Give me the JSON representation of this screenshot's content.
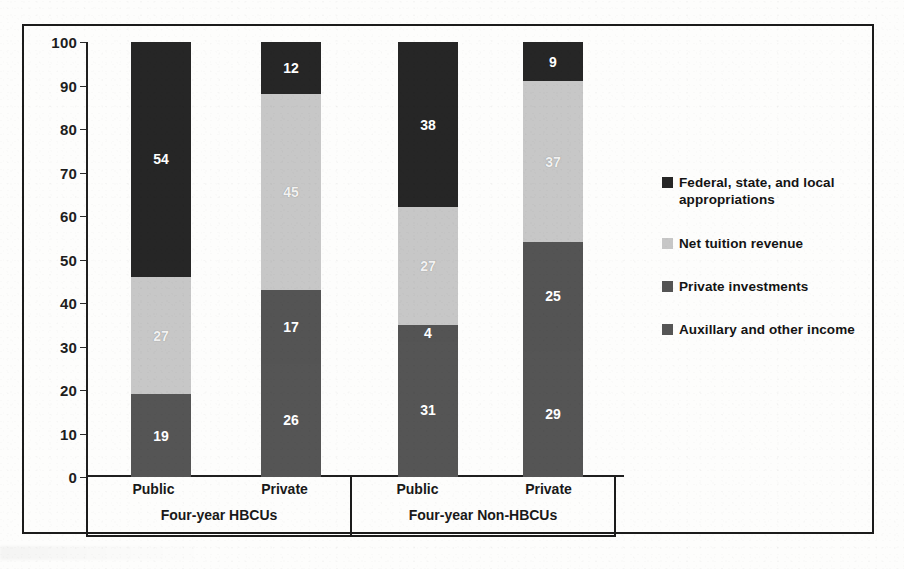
{
  "chart_data": {
    "type": "bar",
    "stacked": true,
    "orientation": "vertical",
    "title": "",
    "subtitle": "",
    "xlabel": "",
    "ylabel": "",
    "ylim": [
      0,
      100
    ],
    "yticks": [
      0,
      10,
      20,
      30,
      40,
      50,
      60,
      70,
      80,
      90,
      100
    ],
    "ytick_labels": [
      "0",
      "10",
      "20",
      "30",
      "40",
      "50",
      "60",
      "70",
      "80",
      "90",
      "100"
    ],
    "grid": false,
    "legend_position": "right",
    "categories": [
      "Public",
      "Private",
      "Public",
      "Private"
    ],
    "groups": [
      {
        "label": "Four-year HBCUs",
        "categories": [
          "Public",
          "Private"
        ]
      },
      {
        "label": "Four-year Non-HBCUs",
        "categories": [
          "Public",
          "Private"
        ]
      }
    ],
    "series": [
      {
        "name": "Federal, state, and local appropriations",
        "color": "#262626",
        "values": [
          54,
          12,
          38,
          9
        ]
      },
      {
        "name": "Net tuition revenue",
        "color": "#c7c7c7",
        "values": [
          27,
          45,
          27,
          37
        ]
      },
      {
        "name": "Private investments",
        "color": "#545454",
        "values": [
          0,
          17,
          4,
          25
        ]
      },
      {
        "name": "Auxillary and other income",
        "color": "#555555",
        "values": [
          19,
          26,
          31,
          29
        ]
      }
    ],
    "bars": [
      {
        "group": "Four-year HBCUs",
        "category": "Public",
        "segments": [
          {
            "series": "Auxillary and other income",
            "value": 19,
            "label": "19",
            "color": "#555555"
          },
          {
            "series": "Private investments",
            "value": 0,
            "label": "",
            "color": "#545454"
          },
          {
            "series": "Net tuition revenue",
            "value": 27,
            "label": "27",
            "color": "#c7c7c7"
          },
          {
            "series": "Federal, state, and local appropriations",
            "value": 54,
            "label": "54",
            "color": "#262626"
          }
        ],
        "total": 100
      },
      {
        "group": "Four-year HBCUs",
        "category": "Private",
        "segments": [
          {
            "series": "Auxillary and other income",
            "value": 26,
            "label": "26",
            "color": "#555555"
          },
          {
            "series": "Private investments",
            "value": 17,
            "label": "17",
            "color": "#545454"
          },
          {
            "series": "Net tuition revenue",
            "value": 45,
            "label": "45",
            "color": "#c7c7c7"
          },
          {
            "series": "Federal, state, and local appropriations",
            "value": 12,
            "label": "12",
            "color": "#262626"
          }
        ],
        "total": 100
      },
      {
        "group": "Four-year Non-HBCUs",
        "category": "Public",
        "segments": [
          {
            "series": "Auxillary and other income",
            "value": 31,
            "label": "31",
            "color": "#555555"
          },
          {
            "series": "Private investments",
            "value": 4,
            "label": "4",
            "color": "#545454"
          },
          {
            "series": "Net tuition revenue",
            "value": 27,
            "label": "27",
            "color": "#c7c7c7"
          },
          {
            "series": "Federal, state, and local appropriations",
            "value": 38,
            "label": "38",
            "color": "#262626"
          }
        ],
        "total": 100
      },
      {
        "group": "Four-year Non-HBCUs",
        "category": "Private",
        "segments": [
          {
            "series": "Auxillary and other income",
            "value": 29,
            "label": "29",
            "color": "#555555"
          },
          {
            "series": "Private investments",
            "value": 25,
            "label": "25",
            "color": "#545454"
          },
          {
            "series": "Net tuition revenue",
            "value": 37,
            "label": "37",
            "color": "#c7c7c7"
          },
          {
            "series": "Federal, state, and local appropriations",
            "value": 9,
            "label": "9",
            "color": "#262626"
          }
        ],
        "total": 100
      }
    ],
    "legend": [
      {
        "label": "Federal, state, and local appropriations",
        "color": "#262626"
      },
      {
        "label": "Net tuition revenue",
        "color": "#c7c7c7"
      },
      {
        "label": "Private investments",
        "color": "#545454"
      },
      {
        "label": "Auxillary and other income",
        "color": "#555555"
      }
    ]
  }
}
